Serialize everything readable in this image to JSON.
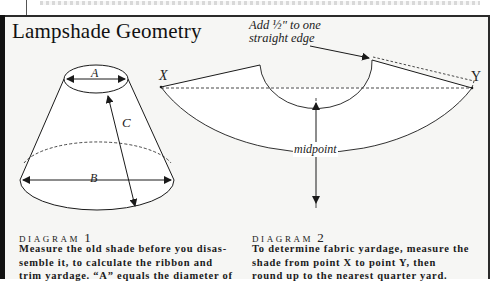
{
  "title": "Lampshade Geometry",
  "diagram1": {
    "label_word": "DIAGRAM",
    "label_num": "1",
    "caption_lines": [
      "Measure the old shade before you disas-",
      "semble it, to calculate the ribbon and",
      "trim yardage. “A” equals the diameter of"
    ],
    "labels": {
      "a": "A",
      "b": "B",
      "c": "C"
    }
  },
  "diagram2": {
    "label_word": "DIAGRAM",
    "label_num": "2",
    "caption_lines": [
      "To determine fabric yardage, measure the",
      "shade from point X to point Y, then",
      "round up to the nearest quarter yard."
    ],
    "labels": {
      "x": "X",
      "y": "Y",
      "midpoint": "midpoint"
    },
    "annotation_lines": [
      "Add ½\" to one",
      "straight edge"
    ]
  },
  "colors": {
    "ink": "#1a1a1a",
    "panel": "#f6f6f4",
    "frame": "#2a2a2a"
  }
}
